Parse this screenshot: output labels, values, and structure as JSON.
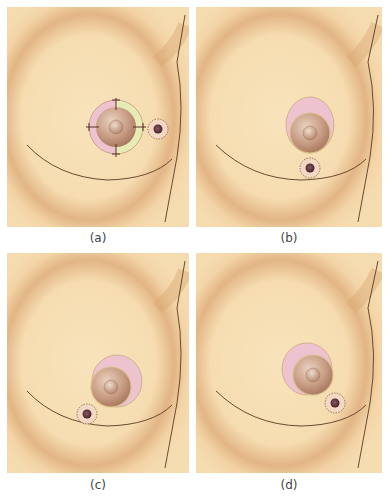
{
  "figure": {
    "colors": {
      "skin": "#f6dcb0",
      "skin_shadow": "#d9a873",
      "outline": "#5a3a22",
      "areola": "#b88a6e",
      "areola_light": "#e7cbb8",
      "nipple": "#c59a80",
      "pink_ring": "#ecc3cf",
      "green_ring": "#e7ecb4",
      "lesion": "#5a2f3a",
      "dotted_ring": "#8a5a3c"
    },
    "panels": [
      {
        "id": "a",
        "caption": "(a)",
        "description": "Lesion lateral to areola; areola outer ring with pink and green halves, crosshair marks at four quadrants"
      },
      {
        "id": "b",
        "caption": "(b)",
        "description": "Lesion inferior to areola; pink crescent superior to areola"
      },
      {
        "id": "c",
        "caption": "(c)",
        "description": "Lesion inferomedial to areola; pink crescent superolateral"
      },
      {
        "id": "d",
        "caption": "(d)",
        "description": "Lesion inferolateral to areola; pink crescent superomedial"
      }
    ]
  }
}
